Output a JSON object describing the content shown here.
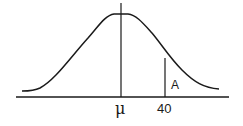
{
  "diagram": {
    "type": "normal-distribution-curve",
    "labels": {
      "mean": "μ",
      "x_value": "40",
      "area": "A"
    },
    "colors": {
      "stroke": "#1a1a1a",
      "background": "#ffffff"
    }
  }
}
